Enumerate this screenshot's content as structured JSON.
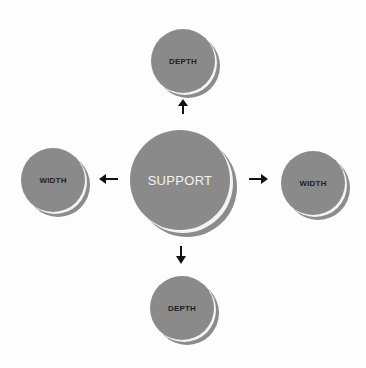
{
  "diagram": {
    "center": {
      "label": "SUPPORT"
    },
    "nodes": {
      "top": {
        "label": "DEPTH"
      },
      "bottom": {
        "label": "DEPTH"
      },
      "left": {
        "label": "WIDTH"
      },
      "right": {
        "label": "WIDTH"
      }
    },
    "arrows": [
      "up",
      "down",
      "left",
      "right"
    ],
    "colors": {
      "disc_fill": "#8a8a8a",
      "outer_label": "#1f1f1f",
      "center_label": "#f2f2f2",
      "arrow": "#111111"
    }
  }
}
